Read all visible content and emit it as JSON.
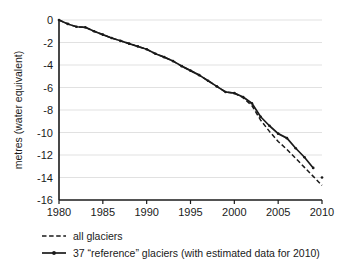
{
  "chart_data": {
    "type": "line",
    "title": "",
    "subtitle": "",
    "xlabel": "",
    "ylabel": "metres  (water equivalent)",
    "xlim": [
      1980,
      2010
    ],
    "ylim": [
      -16,
      0
    ],
    "xticks": [
      1980,
      1985,
      1990,
      1995,
      2000,
      2005,
      2010
    ],
    "yticks": [
      0,
      -2,
      -4,
      -6,
      -8,
      -10,
      -12,
      -14,
      -16
    ],
    "xticklabels": [
      "1980",
      "1985",
      "1990",
      "1995",
      "2000",
      "2005",
      "2010"
    ],
    "yticklabels": [
      "0",
      "-2",
      "-4",
      "-6",
      "-8",
      "-10",
      "-12",
      "-14",
      "-16"
    ],
    "grid": "horizontal",
    "legend_position": "below",
    "x": [
      1980,
      1981,
      1982,
      1983,
      1984,
      1985,
      1986,
      1987,
      1988,
      1989,
      1990,
      1991,
      1992,
      1993,
      1994,
      1995,
      1996,
      1997,
      1998,
      1999,
      2000,
      2001,
      2002,
      2003,
      2004,
      2005,
      2006,
      2007,
      2008,
      2009,
      2010
    ],
    "series": [
      {
        "name": "all glaciers",
        "style": "dashed",
        "markers": false,
        "color": "#1a1a1a",
        "values": [
          0.0,
          -0.35,
          -0.6,
          -0.65,
          -1.0,
          -1.3,
          -1.6,
          -1.85,
          -2.1,
          -2.35,
          -2.6,
          -3.0,
          -3.3,
          -3.65,
          -4.1,
          -4.5,
          -4.9,
          -5.4,
          -5.9,
          -6.4,
          -6.5,
          -6.9,
          -7.6,
          -8.9,
          -9.9,
          -10.8,
          -11.5,
          -12.3,
          -13.1,
          -13.9,
          -14.7
        ]
      },
      {
        "name": "37 “reference” glaciers (with estimated data for 2010)",
        "style": "solid",
        "markers": true,
        "color": "#1a1a1a",
        "values": [
          0.0,
          -0.35,
          -0.6,
          -0.65,
          -1.0,
          -1.3,
          -1.6,
          -1.85,
          -2.1,
          -2.35,
          -2.6,
          -3.0,
          -3.3,
          -3.65,
          -4.1,
          -4.5,
          -4.9,
          -5.4,
          -5.9,
          -6.4,
          -6.5,
          -6.85,
          -7.4,
          -8.6,
          -9.4,
          -10.1,
          -10.5,
          -11.4,
          -12.2,
          -13.15,
          -14.0
        ],
        "note": "final 2010 point is an isolated estimated marker"
      }
    ],
    "legend": [
      {
        "label": "all glaciers",
        "style": "dashed",
        "marker": false
      },
      {
        "label": "37 “reference” glaciers (with estimated data for 2010)",
        "style": "solid",
        "marker": true
      }
    ]
  }
}
